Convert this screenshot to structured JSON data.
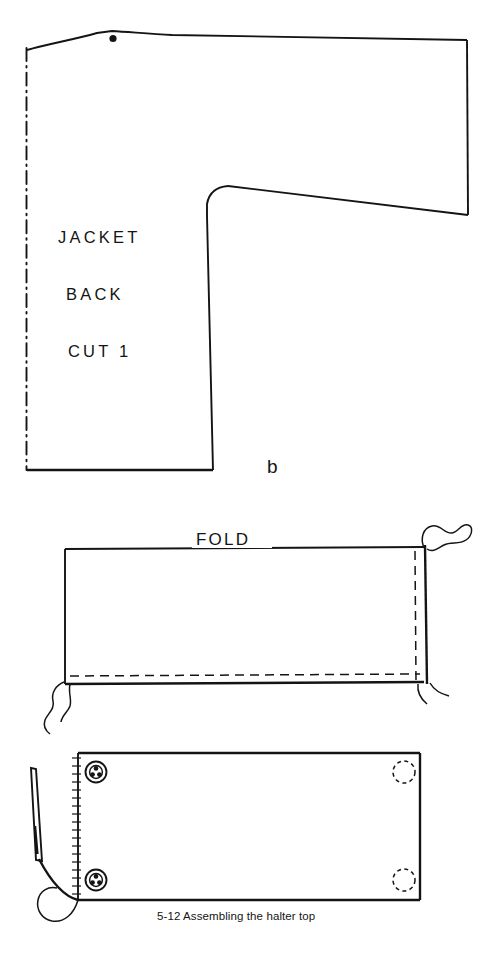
{
  "figure": {
    "caption": "5-12  Assembling the halter top",
    "panel_label": "b",
    "ink_color": "#141414",
    "background_color": "#ffffff"
  },
  "pattern_piece": {
    "name_line_1": "JACKET",
    "name_line_2": "BACK",
    "cut_instruction": "CUT 1",
    "fold_edge_style": "dash-dot center fold line",
    "markings": {
      "shoulder_dot": "pattern-match dot"
    }
  },
  "fold_panel": {
    "fold_label": "FOLD",
    "stitch_line_style": "dashed",
    "edge_break_marks": 2
  },
  "halter_panel": {
    "snap_studs": 2,
    "snap_sockets": 2,
    "needle": "threaded hand-sewing needle",
    "edge_finish": "overcast hatching"
  }
}
